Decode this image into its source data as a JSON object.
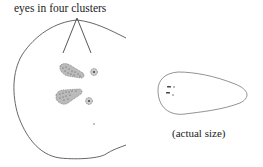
{
  "diagram": {
    "labels": {
      "eyes_caption": "eyes in four clusters",
      "actual_size_caption": "(actual size)"
    },
    "colors": {
      "outline": "#555555",
      "ink": "#333333",
      "background": "#ffffff"
    },
    "parts": [
      "enlarged-head-outline",
      "pointer-lines",
      "eye-cluster-upper-elongated",
      "eye-cluster-upper-round",
      "eye-cluster-lower-elongated",
      "eye-cluster-lower-round",
      "small-dot",
      "actual-size-body-outline"
    ]
  }
}
